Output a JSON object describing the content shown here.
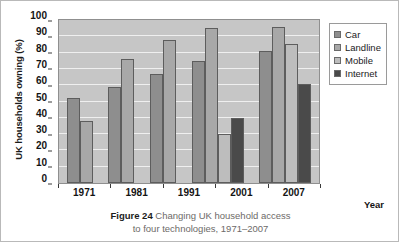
{
  "chart_data": {
    "type": "bar",
    "title": "",
    "xlabel": "Year",
    "ylabel": "UK households owning (%)",
    "categories": [
      "1971",
      "1981",
      "1991",
      "2001",
      "2007"
    ],
    "ylim": [
      0,
      100
    ],
    "ytick_labels": [
      "0",
      "10",
      "20",
      "30",
      "40",
      "50",
      "60",
      "70",
      "80",
      "90",
      "100"
    ],
    "ytick_values": [
      0,
      10,
      20,
      30,
      40,
      50,
      60,
      70,
      80,
      90,
      100
    ],
    "grid": true,
    "legend_position": "right",
    "series": [
      {
        "name": "Car",
        "color": "#8e8e8e",
        "values": [
          52,
          59,
          67,
          75,
          81
        ]
      },
      {
        "name": "Landline",
        "color": "#a8a8a8",
        "values": [
          38,
          76,
          88,
          95,
          96
        ]
      },
      {
        "name": "Mobile",
        "color": "#bdbdbd",
        "values": [
          null,
          null,
          null,
          30,
          85
        ]
      },
      {
        "name": "Internet",
        "color": "#4a4a4a",
        "values": [
          null,
          null,
          null,
          40,
          61
        ]
      }
    ]
  },
  "legend": {
    "items": [
      {
        "label": "Car",
        "color": "#8e8e8e"
      },
      {
        "label": "Landline",
        "color": "#a8a8a8"
      },
      {
        "label": "Mobile",
        "color": "#bdbdbd"
      },
      {
        "label": "Internet",
        "color": "#4a4a4a"
      }
    ]
  },
  "caption": {
    "figure_number": "Figure 24",
    "line1": " Changing UK household access",
    "line2": "to four technologies, 1971–2007"
  },
  "colors": {
    "plot_background": "#c6c6c6",
    "gridline": "#efefef",
    "bar_border": "#5d5d5d",
    "axis": "#3a3a3a",
    "caption_text": "#6d6a68"
  }
}
